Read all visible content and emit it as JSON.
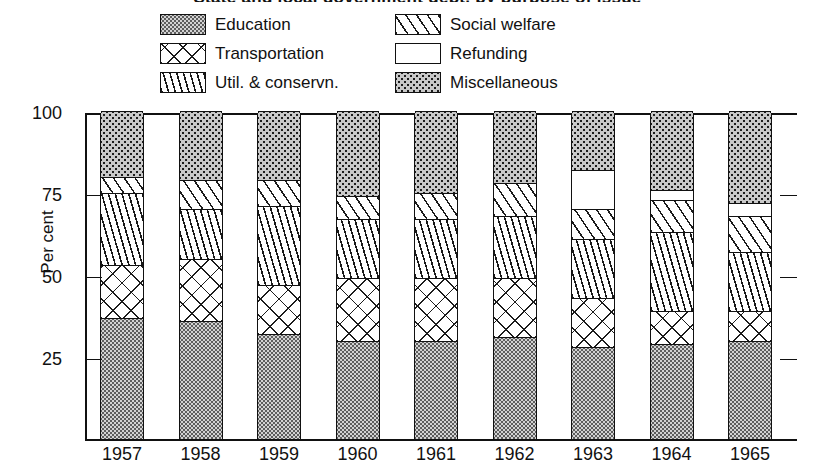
{
  "title_sliver": "State and local government debt, by purpose of issue",
  "legend": {
    "items": [
      {
        "label": "Education",
        "pattern": "education",
        "col": 0
      },
      {
        "label": "Social welfare",
        "pattern": "social",
        "col": 1
      },
      {
        "label": "Transportation",
        "pattern": "transportation",
        "col": 0
      },
      {
        "label": "Refunding",
        "pattern": "refunding",
        "col": 1
      },
      {
        "label": "Util. & conservn.",
        "pattern": "util",
        "col": 0
      },
      {
        "label": "Miscellaneous",
        "pattern": "miscellaneous",
        "col": 1
      }
    ]
  },
  "axes": {
    "ylabel": "Per cent",
    "yticks": [
      100,
      75,
      50,
      25
    ],
    "ylim": [
      0,
      100
    ],
    "xticks": [
      "1957",
      "1958",
      "1959",
      "1960",
      "1961",
      "1962",
      "1963",
      "1964",
      "1965"
    ],
    "grid": "none",
    "right_axis_ticks": [
      75,
      50,
      25
    ]
  },
  "chart_data": {
    "type": "bar",
    "subtype": "stacked-100-percent",
    "title": "State and local government debt, by purpose of issue",
    "xlabel": "",
    "ylabel": "Per cent",
    "ylim": [
      0,
      100
    ],
    "yticks": [
      25,
      50,
      75,
      100
    ],
    "grid": false,
    "legend_position": "top",
    "categories": [
      "1957",
      "1958",
      "1959",
      "1960",
      "1961",
      "1962",
      "1963",
      "1964",
      "1965"
    ],
    "stack_order_bottom_to_top": [
      "Education",
      "Transportation",
      "Util. & conservn.",
      "Social welfare",
      "Refunding",
      "Miscellaneous"
    ],
    "series": [
      {
        "name": "Education",
        "pattern": "education",
        "values": [
          37,
          36,
          32,
          30,
          30,
          31,
          28,
          29,
          30
        ]
      },
      {
        "name": "Transportation",
        "pattern": "transportation",
        "values": [
          16,
          19,
          15,
          19,
          19,
          18,
          15,
          10,
          9
        ]
      },
      {
        "name": "Util. & conservn.",
        "pattern": "util",
        "values": [
          22,
          15,
          24,
          18,
          18,
          19,
          18,
          24,
          18
        ]
      },
      {
        "name": "Social welfare",
        "pattern": "social",
        "values": [
          5,
          9,
          8,
          7,
          8,
          10,
          9,
          10,
          11
        ]
      },
      {
        "name": "Refunding",
        "pattern": "refunding",
        "values": [
          0,
          0,
          0,
          0,
          0,
          0,
          12,
          3,
          4
        ]
      },
      {
        "name": "Miscellaneous",
        "pattern": "miscellaneous",
        "values": [
          20,
          21,
          21,
          26,
          25,
          22,
          18,
          24,
          28
        ]
      }
    ]
  }
}
